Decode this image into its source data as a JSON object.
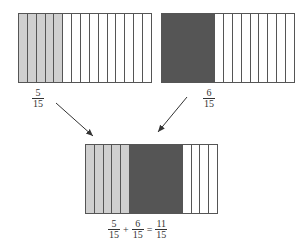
{
  "diagram": {
    "strips_per_bar": 15,
    "colors": {
      "light": "#cfcfcf",
      "dark": "#555555",
      "empty": "#ffffff",
      "line": "#555555"
    },
    "left_bar": {
      "shaded": 5,
      "shade": "light",
      "label": {
        "num": "5",
        "den": "15"
      }
    },
    "right_bar": {
      "shaded": 6,
      "shade": "dark",
      "label": {
        "num": "6",
        "den": "15"
      }
    },
    "result_bar": {
      "light": 5,
      "dark": 6
    },
    "equation": {
      "term1": {
        "num": "5",
        "den": "15"
      },
      "plus": "+",
      "term2": {
        "num": "6",
        "den": "15"
      },
      "equals": "=",
      "result": {
        "num": "11",
        "den": "15"
      }
    }
  }
}
